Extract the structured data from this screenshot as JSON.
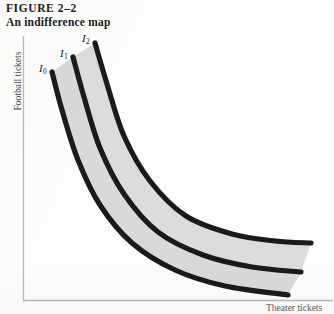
{
  "figure": {
    "number_line": "FIGURE  2–2",
    "title_line": "An indifference map"
  },
  "axes": {
    "y_label": "Football tickets",
    "x_label": "Theater tickets"
  },
  "curve_labels": {
    "i0": "I",
    "i0_sub": "0",
    "i1": "I",
    "i1_sub": "1",
    "i2": "I",
    "i2_sub": "2"
  },
  "chart_data": {
    "type": "line",
    "title": "An indifference map",
    "xlabel": "Theater tickets",
    "ylabel": "Football tickets",
    "grid": false,
    "legend": "inline-curve-labels",
    "axis_color": "#b9b9b9",
    "curve_color": "#1a1a1a",
    "band_fill": "#d9d9d9",
    "background": "#fdfdfc",
    "curve_stroke_width": 5.2,
    "xlim": [
      0,
      334
    ],
    "ylim": [
      314,
      0
    ],
    "series": [
      {
        "name": "I0",
        "label": "I₀",
        "utility_rank": 1,
        "points": [
          [
            52,
            72
          ],
          [
            62,
            110
          ],
          [
            78,
            160
          ],
          [
            100,
            205
          ],
          [
            132,
            243
          ],
          [
            175,
            270
          ],
          [
            225,
            286
          ],
          [
            288,
            295
          ]
        ]
      },
      {
        "name": "I1",
        "label": "I₁",
        "utility_rank": 2,
        "points": [
          [
            73,
            57
          ],
          [
            84,
            97
          ],
          [
            100,
            148
          ],
          [
            124,
            194
          ],
          [
            158,
            232
          ],
          [
            203,
            255
          ],
          [
            252,
            267
          ],
          [
            301,
            272
          ]
        ]
      },
      {
        "name": "I2",
        "label": "I₂",
        "utility_rank": 3,
        "points": [
          [
            95,
            43
          ],
          [
            107,
            84
          ],
          [
            124,
            136
          ],
          [
            150,
            181
          ],
          [
            186,
            216
          ],
          [
            232,
            234
          ],
          [
            275,
            241
          ],
          [
            311,
            243
          ]
        ]
      }
    ],
    "shaded_bands": [
      {
        "between": [
          "I0",
          "I1"
        ],
        "fill": "#d9d9d9"
      },
      {
        "between": [
          "I1",
          "I2"
        ],
        "fill": "#dcdcdc"
      }
    ],
    "annotations": [
      {
        "text": "I₀",
        "x": 43,
        "y": 70,
        "series": "I0"
      },
      {
        "text": "I₁",
        "x": 64,
        "y": 55,
        "series": "I1"
      },
      {
        "text": "I₂",
        "x": 86,
        "y": 40,
        "series": "I2"
      }
    ]
  }
}
